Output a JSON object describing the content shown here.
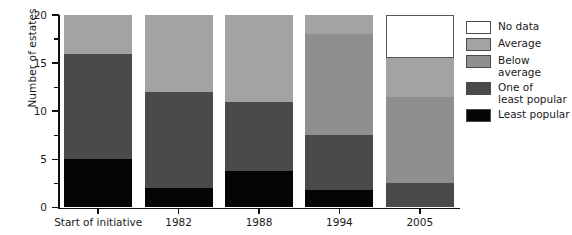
{
  "chart_data": {
    "type": "bar",
    "subtype": "stacked-bar",
    "title": "",
    "xlabel": "",
    "ylabel": "Number of estates",
    "ylim": [
      0,
      20
    ],
    "yticks": [
      0,
      5,
      10,
      15,
      20
    ],
    "ytick_labels": [
      "0",
      "5",
      "10",
      "15",
      "20"
    ],
    "y_minor_ticks": [
      2.5,
      7.5,
      12.5,
      17.5
    ],
    "grid": false,
    "legend_position": "right",
    "categories": [
      "Start of initiative",
      "1982",
      "1988",
      "1994",
      "2005"
    ],
    "series": [
      {
        "name": "Least popular",
        "color": "#050505",
        "values": [
          5,
          2,
          3.8,
          1.8,
          0
        ]
      },
      {
        "name": "One of least popular",
        "color": "#4a4a4a",
        "values": [
          11,
          10,
          7.2,
          5.7,
          2.5
        ]
      },
      {
        "name": "Below average",
        "color": "#8f8f8f",
        "values": [
          0,
          0,
          0,
          10.5,
          9
        ]
      },
      {
        "name": "Average",
        "color": "#a3a3a3",
        "values": [
          4,
          8,
          9,
          2,
          4
        ]
      },
      {
        "name": "No data",
        "color": "#ffffff",
        "values": [
          0,
          0,
          0,
          0,
          4.5
        ]
      }
    ],
    "totals": [
      20,
      20,
      20,
      20,
      20
    ],
    "annotations": []
  },
  "axes": {
    "y_title": "Number of estates"
  },
  "legend": {
    "items": [
      {
        "label": "No data",
        "color": "#ffffff"
      },
      {
        "label": "Average",
        "color": "#a3a3a3"
      },
      {
        "label": "Below average",
        "color": "#8f8f8f"
      },
      {
        "label": "One of\nleast popular",
        "color": "#4a4a4a"
      },
      {
        "label": "Least popular",
        "color": "#050505"
      }
    ]
  }
}
